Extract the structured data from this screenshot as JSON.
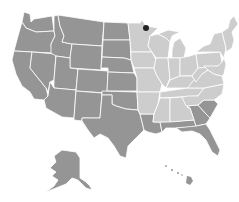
{
  "map": {
    "title": "",
    "colors": {
      "background": "#ffffff",
      "region_dark": "#959595",
      "region_light": "#cdcdcd",
      "border": "#ffffff",
      "marker": "#222222"
    },
    "regions": [
      {
        "name": "dark",
        "color": "#959595",
        "states": [
          "WA",
          "OR",
          "CA",
          "NV",
          "ID",
          "MT",
          "WY",
          "UT",
          "AZ",
          "CO",
          "NM",
          "ND",
          "SD",
          "NE",
          "KS",
          "OK",
          "TX",
          "LA",
          "MS-coast",
          "AL-coast",
          "GA",
          "SC",
          "FL",
          "AK",
          "HI"
        ]
      },
      {
        "name": "light",
        "color": "#cdcdcd",
        "states": [
          "MN",
          "IA",
          "MO",
          "AR",
          "WI",
          "IL",
          "MI",
          "IN",
          "OH",
          "KY",
          "TN",
          "MS",
          "AL",
          "NC",
          "VA",
          "WV",
          "PA",
          "NY",
          "NJ",
          "DE",
          "MD",
          "CT",
          "RI",
          "MA",
          "VT",
          "NH",
          "ME"
        ]
      }
    ],
    "markers": [
      {
        "name": "location-marker",
        "x": 146,
        "y": 28,
        "r": 3
      }
    ]
  }
}
